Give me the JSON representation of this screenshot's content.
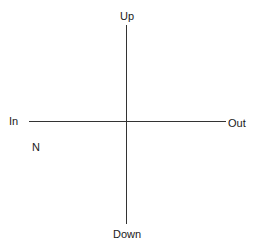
{
  "diagram": {
    "type": "axis-cross",
    "line_color": "#333333",
    "labels": {
      "top": "Up",
      "bottom": "Down",
      "left": "In",
      "right": "Out",
      "lower_left": "N"
    }
  }
}
